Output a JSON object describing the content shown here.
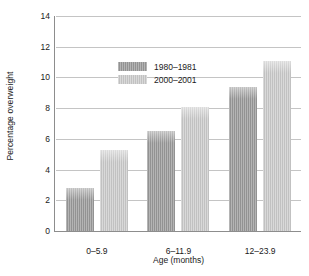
{
  "chart_data": {
    "type": "bar",
    "title": "",
    "subtitle": "",
    "xlabel": "Age (months)",
    "ylabel": "Percentage overweight",
    "categories": [
      "0–5.9",
      "6–11.9",
      "12–23.9"
    ],
    "series": [
      {
        "name": "1980–1981",
        "values": [
          2.8,
          6.5,
          9.4
        ],
        "color": "#9a9a9a"
      },
      {
        "name": "2000–2001",
        "values": [
          5.3,
          8.1,
          11.1
        ],
        "color": "#c9c9c9"
      }
    ],
    "ylim": [
      0,
      14
    ],
    "yticks": [
      0,
      2,
      4,
      6,
      8,
      10,
      12,
      14
    ],
    "ytick_labels": [
      "0",
      "2",
      "4",
      "6",
      "8",
      "10",
      "12",
      "14"
    ],
    "grid": true,
    "grid_axis": "y",
    "legend_position": "upper left",
    "annotations": [],
    "gridline_color": "#c4c4c4",
    "axis_color": "#8d8d8d"
  },
  "legend": {
    "items": [
      {
        "label": "1980–1981",
        "swatch": "#9a9a9a"
      },
      {
        "label": "2000–2001",
        "swatch": "#c9c9c9"
      }
    ]
  }
}
